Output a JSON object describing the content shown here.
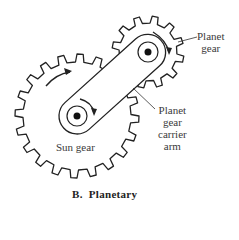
{
  "figure": {
    "caption": "B.  Planetary",
    "labels": {
      "planet_gear": [
        "Planet",
        "gear"
      ],
      "carrier_arm": [
        "Planet",
        "gear",
        "carrier",
        "arm"
      ],
      "sun_gear": "Sun gear"
    }
  },
  "geometry": {
    "sun_gear": {
      "cx": 77,
      "cy": 116,
      "tip_r": 62,
      "root_r": 54,
      "teeth": 20
    },
    "planet_gear": {
      "cx": 148,
      "cy": 52,
      "tip_r": 36,
      "root_r": 29,
      "teeth": 12
    },
    "stroke_color": "#222222"
  }
}
